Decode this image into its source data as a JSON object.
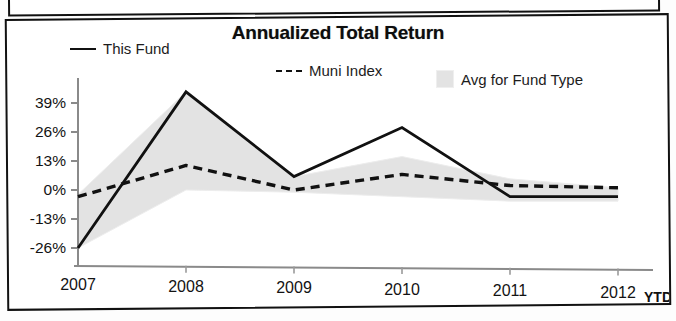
{
  "chart_data": {
    "type": "line",
    "title": "Annualized Total Return",
    "xlabel": "",
    "ylabel": "",
    "categories": [
      "2007",
      "2008",
      "2009",
      "2010",
      "2011",
      "2012"
    ],
    "last_category_suffix": "YTD",
    "ylim": [
      -26,
      44
    ],
    "yticks": [
      39,
      26,
      13,
      0,
      -13,
      -26
    ],
    "ytick_labels": [
      "39%",
      "26%",
      "13%",
      "0%",
      "-13%",
      "-26%"
    ],
    "grid": false,
    "legend_position": "top",
    "series": [
      {
        "name": "This Fund",
        "style": "solid",
        "color": "#111111",
        "values": [
          -26,
          44,
          6,
          28,
          -3,
          -3
        ]
      },
      {
        "name": "Muni Index",
        "style": "dashed",
        "color": "#111111",
        "values": [
          -3,
          11,
          0,
          7,
          2,
          1
        ]
      },
      {
        "name": "Avg for Fund Type",
        "style": "area",
        "color": "#e3e3e3",
        "upper": [
          -2,
          44,
          6,
          15,
          5,
          1
        ],
        "lower": [
          -26,
          0,
          -1,
          -3,
          -5,
          -5
        ]
      }
    ]
  },
  "legend": {
    "this_fund": "This Fund",
    "muni_index": "Muni Index",
    "avg_fund_type": "Avg for Fund Type",
    "muni_index_prefix": "---"
  },
  "axis": {
    "ytd": "YTD"
  }
}
